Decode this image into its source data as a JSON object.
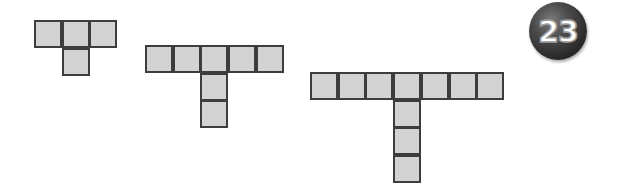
{
  "badge": {
    "number": "23",
    "color": "#2a2a2a"
  },
  "figure": {
    "cell_fill": "#d3d3d3",
    "cell_border": "#3d3d3d",
    "cell_size": 28,
    "shapes": [
      {
        "name": "shape-1",
        "top_row_cells": 3,
        "stem_cells": 1,
        "total_squares": 4,
        "origin": [
          34,
          20
        ]
      },
      {
        "name": "shape-2",
        "top_row_cells": 5,
        "stem_cells": 2,
        "total_squares": 7,
        "origin": [
          145,
          45
        ]
      },
      {
        "name": "shape-3",
        "top_row_cells": 7,
        "stem_cells": 3,
        "total_squares": 10,
        "origin": [
          310,
          72
        ]
      }
    ]
  }
}
